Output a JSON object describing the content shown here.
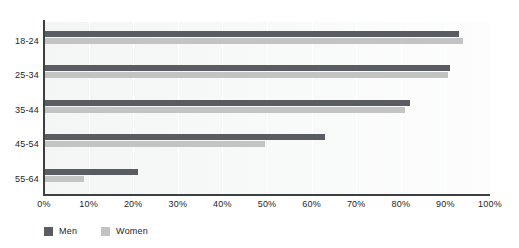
{
  "figure": {
    "clipped_header_text": "",
    "background_color": "#ffffff",
    "plot_background_color": "#f7f8f8",
    "axis_color": "#3c4043"
  },
  "chart_data": {
    "type": "bar",
    "orientation": "horizontal",
    "title": "",
    "xlabel": "",
    "ylabel": "",
    "categories": [
      "18-24",
      "25-34",
      "35-44",
      "45-54",
      "55-64"
    ],
    "series": [
      {
        "name": "Men",
        "color": "#595d61",
        "values": [
          93,
          91,
          82,
          63,
          21
        ]
      },
      {
        "name": "Women",
        "color": "#c2c4c3",
        "values": [
          94,
          90.5,
          81,
          49.5,
          9
        ]
      }
    ],
    "xlim": [
      0,
      100
    ],
    "xticks": [
      0,
      10,
      20,
      30,
      40,
      50,
      60,
      70,
      80,
      90,
      100
    ],
    "xtick_labels": [
      "0%",
      "10%",
      "20%",
      "30%",
      "40%",
      "50%",
      "60%",
      "70%",
      "80%",
      "90%",
      "100%"
    ],
    "value_unit": "%",
    "grid": true,
    "grid_axis": "x",
    "grid_color": "#ffffff",
    "legend_position": "bottom-left",
    "legend": [
      {
        "label": "Men",
        "color": "#595d61"
      },
      {
        "label": "Women",
        "color": "#c2c4c3"
      }
    ]
  }
}
